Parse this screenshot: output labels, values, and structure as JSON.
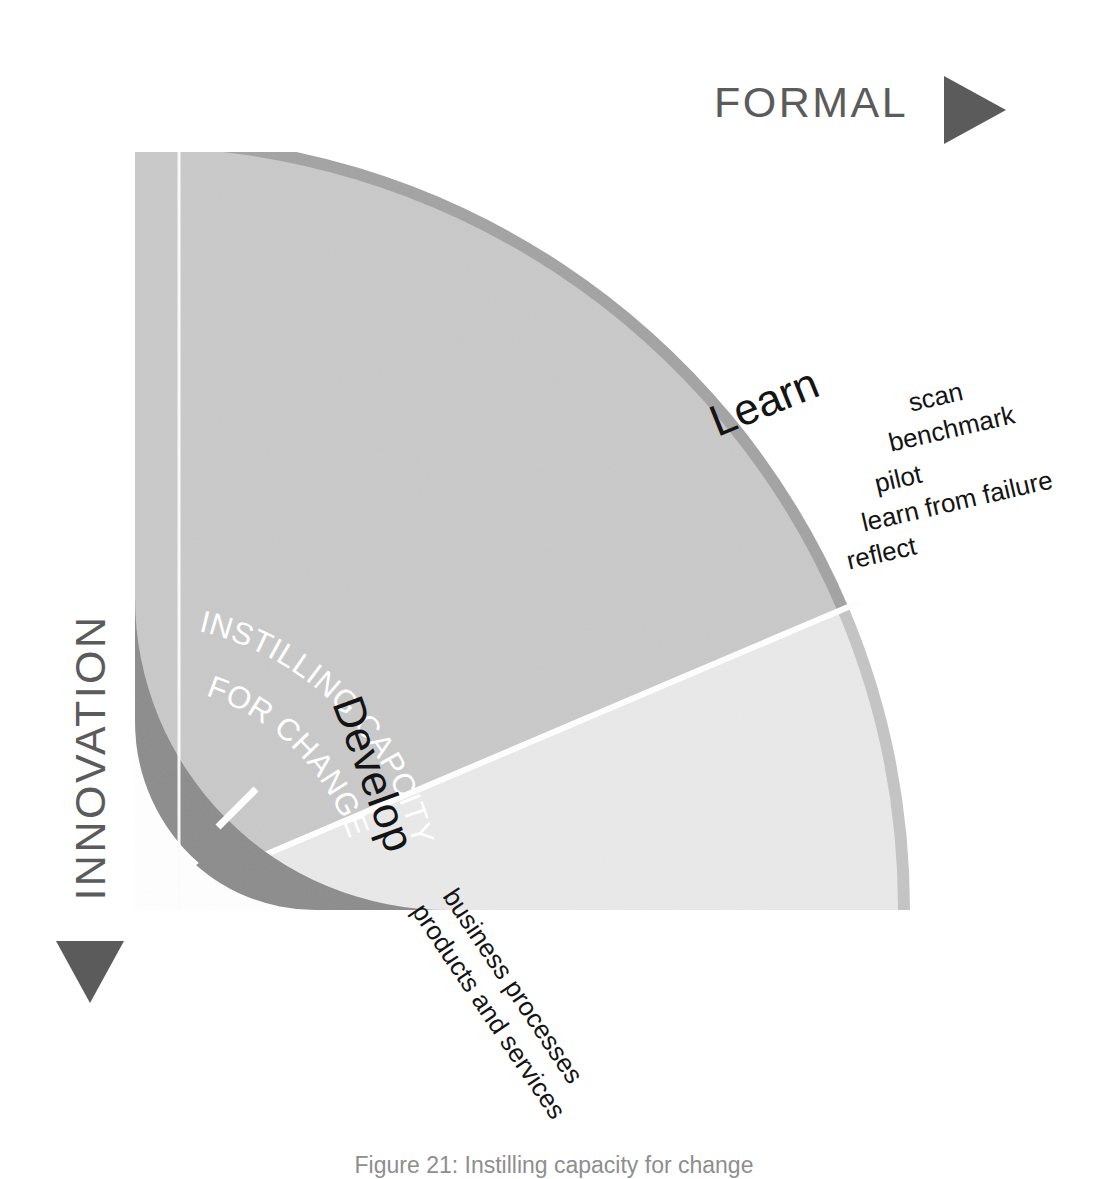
{
  "figure": {
    "caption": "Figure 21:  Instilling capacity for change",
    "axes": {
      "horizontal": {
        "label": "FORMAL",
        "arrow_icon": "triangle-right-icon",
        "direction": "right"
      },
      "vertical": {
        "label": "INNOVATION",
        "arrow_icon": "triangle-down-icon",
        "direction": "down"
      }
    },
    "inner_ring": {
      "line1": "INSTILLING CAPCITY",
      "line2": "FOR CHANGE",
      "text_color": "#ffffff",
      "fill": "#8c8c8c"
    },
    "sectors": [
      {
        "id": "learn",
        "title": "Learn",
        "fill": "#c9c9c9",
        "rim": "#a3a3a3",
        "annotations": [
          "scan",
          "benchmark",
          "pilot",
          "learn from failure",
          "reflect"
        ]
      },
      {
        "id": "develop",
        "title": "Develop",
        "fill": "#e9e9e9",
        "rim": "#c4c4c4",
        "annotations": [
          "business processes",
          "products and services"
        ]
      }
    ],
    "colors": {
      "background": "#ffffff",
      "axis_text": "#5b5b5b",
      "annotation_text": "#141414",
      "divider": "#ffffff"
    }
  }
}
